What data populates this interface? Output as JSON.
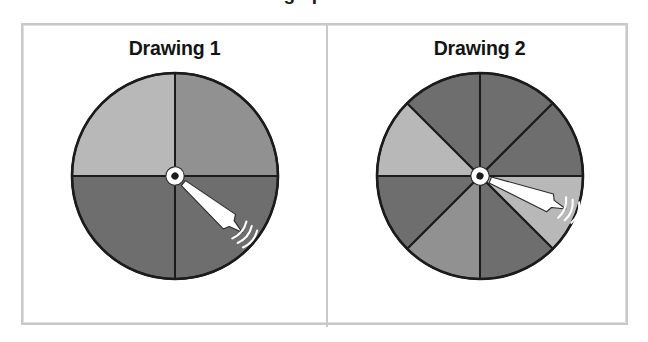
{
  "figure": {
    "cutoff_heading": "ding spinners?",
    "background_color": "#ffffff",
    "frame_color": "#c9c9c9",
    "divider_color": "#c9c9c9"
  },
  "palette": {
    "dark_gray": "#6e6e6e",
    "medium_gray": "#919191",
    "light_gray": "#b8b8b8",
    "outline": "#1b1b1b",
    "pointer": "#ffffff",
    "pointer_outline": "#2a2a2a",
    "hub_center": "#1b1b1b"
  },
  "panels": [
    {
      "title": "Drawing 1",
      "spinner": {
        "name": "spinner-four-sectors",
        "sector_count": 4,
        "sector_degrees": 90,
        "center": {
          "x": 107,
          "y": 107
        },
        "radius": 103,
        "sectors": [
          {
            "index": 1,
            "start_deg": 270,
            "end_deg": 360,
            "color": "#919191",
            "position": "top-left"
          },
          {
            "index": 2,
            "start_deg": 0,
            "end_deg": 90,
            "color": "#6e6e6e",
            "position": "top-right"
          },
          {
            "index": 3,
            "start_deg": 90,
            "end_deg": 180,
            "color": "#6e6e6e",
            "position": "bottom-right"
          },
          {
            "index": 4,
            "start_deg": 180,
            "end_deg": 270,
            "color": "#b8b8b8",
            "position": "bottom-left"
          }
        ],
        "pointer": {
          "angle_deg": 40,
          "length": 88,
          "direction": "down-right",
          "motion_arcs": 3
        }
      }
    },
    {
      "title": "Drawing 2",
      "spinner": {
        "name": "spinner-eight-sectors",
        "sector_count": 8,
        "sector_degrees": 45,
        "center": {
          "x": 107,
          "y": 107
        },
        "radius": 103,
        "sectors": [
          {
            "index": 1,
            "start_deg": 270,
            "end_deg": 315,
            "color": "#6e6e6e",
            "position": "top-left-upper"
          },
          {
            "index": 2,
            "start_deg": 315,
            "end_deg": 360,
            "color": "#6e6e6e",
            "position": "top-right-upper"
          },
          {
            "index": 3,
            "start_deg": 0,
            "end_deg": 45,
            "color": "#b8b8b8",
            "position": "right-upper"
          },
          {
            "index": 4,
            "start_deg": 45,
            "end_deg": 90,
            "color": "#6e6e6e",
            "position": "right-lower"
          },
          {
            "index": 5,
            "start_deg": 90,
            "end_deg": 135,
            "color": "#919191",
            "position": "bottom-right"
          },
          {
            "index": 6,
            "start_deg": 135,
            "end_deg": 180,
            "color": "#6e6e6e",
            "position": "bottom-left"
          },
          {
            "index": 7,
            "start_deg": 180,
            "end_deg": 225,
            "color": "#b8b8b8",
            "position": "left-lower"
          },
          {
            "index": 8,
            "start_deg": 225,
            "end_deg": 270,
            "color": "#6e6e6e",
            "position": "left-upper"
          }
        ],
        "pointer": {
          "angle_deg": 21,
          "length": 92,
          "direction": "right-slightly-down",
          "motion_arcs": 3
        }
      }
    }
  ]
}
